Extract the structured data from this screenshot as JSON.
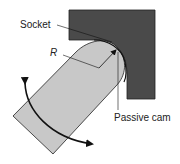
{
  "diagram": {
    "labels": {
      "socket": "Socket",
      "radius": "R",
      "passive_cam": "Passive cam"
    },
    "colors": {
      "socket_fill": "#4a4a4a",
      "finger_fill": "#c8c8c8",
      "stroke": "#111111",
      "background": "#ffffff"
    },
    "components": [
      "socket",
      "finger",
      "passive-cam-contact",
      "rotation-arrow",
      "radius-arrow"
    ]
  }
}
